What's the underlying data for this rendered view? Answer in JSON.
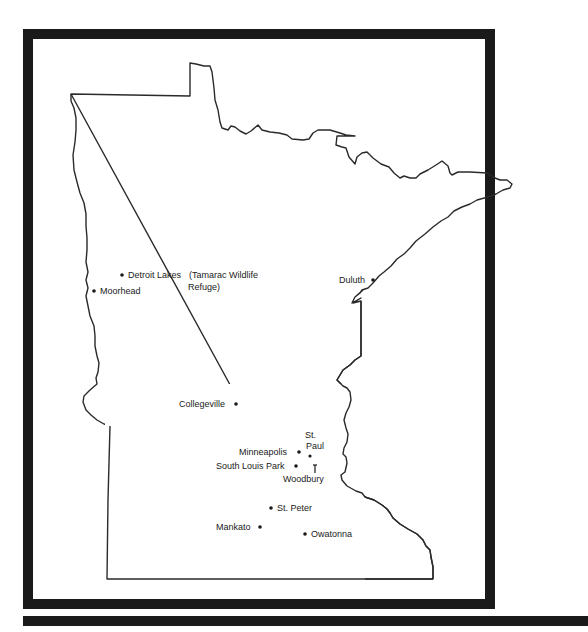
{
  "map": {
    "region": "Minnesota",
    "frame_color": "#1a1a1a",
    "outline_color": "#2a2a2a",
    "background": "#ffffff",
    "cities": [
      {
        "id": "detroit-lakes",
        "label": "Detroit Lakes",
        "x": 122,
        "y": 275
      },
      {
        "id": "tamarac",
        "label_line1": "(Tamarac Wildlife",
        "label_line2": "Refuge)"
      },
      {
        "id": "moorhead",
        "label": "Moorhead",
        "x": 94,
        "y": 291
      },
      {
        "id": "duluth",
        "label": "Duluth",
        "x": 373,
        "y": 280
      },
      {
        "id": "collegeville",
        "label": "Collegeville",
        "x": 236,
        "y": 404
      },
      {
        "id": "st-paul",
        "label_line1": "St.",
        "label_line2": "Paul",
        "x": 310,
        "y": 456
      },
      {
        "id": "minneapolis",
        "label": "Minneapolis",
        "x": 299,
        "y": 452
      },
      {
        "id": "south-louis-park",
        "label": "South Louis Park",
        "x": 296,
        "y": 466
      },
      {
        "id": "woodbury",
        "label": "Woodbury",
        "x": 315,
        "y": 469
      },
      {
        "id": "st-peter",
        "label": "St. Peter",
        "x": 271,
        "y": 508
      },
      {
        "id": "mankato",
        "label": "Mankato",
        "x": 260,
        "y": 527
      },
      {
        "id": "owatonna",
        "label": "Owatonna",
        "x": 305,
        "y": 534
      }
    ]
  }
}
